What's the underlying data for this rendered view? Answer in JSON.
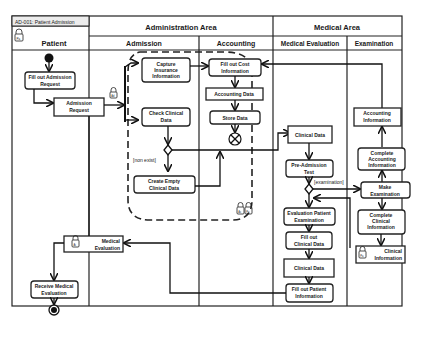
{
  "diagram": {
    "id_label": "AD-001: Patient Admission",
    "groups": [
      {
        "label": "Administration Area"
      },
      {
        "label": "Medical Area"
      }
    ],
    "lanes": [
      {
        "label": "Patient"
      },
      {
        "label": "Admission"
      },
      {
        "label": "Accounting"
      },
      {
        "label": "Medical Evaluation"
      },
      {
        "label": "Examination"
      }
    ],
    "nodes": {
      "fill_admission": [
        "Fill out Admission",
        "Request"
      ],
      "admission_request": [
        "Admission",
        "Request"
      ],
      "capture_insurance": [
        "Capture",
        "Insurance",
        "Information"
      ],
      "check_clinical": [
        "Check Clinical",
        "Data"
      ],
      "create_empty": [
        "Create Empty",
        "Clinical Data"
      ],
      "fill_cost": [
        "Fill out Cost",
        "Information"
      ],
      "accounting_data": [
        "Accounting Data"
      ],
      "store_data": [
        "Store Data"
      ],
      "clinical_data_1": [
        "Clinical Data"
      ],
      "pre_admission": [
        "Pre-Admission",
        "Test"
      ],
      "evaluation_patient": [
        "Evaluation Patient",
        "Examination"
      ],
      "fill_clinical": [
        "Fill out",
        "Clinical Data"
      ],
      "clinical_data_2": [
        "Clinical Data"
      ],
      "fill_patient": [
        "Fill out Patient",
        "Information"
      ],
      "accounting_info": [
        "Accounting",
        "Information"
      ],
      "complete_accounting": [
        "Complete",
        "Accounting",
        "Information"
      ],
      "make_exam": [
        "Make",
        "Examination"
      ],
      "complete_clinical": [
        "Complete",
        "Clinical",
        "Information"
      ],
      "clinical_info": [
        "Clinical",
        "Information"
      ],
      "medical_eval": [
        "Medical",
        "Evaluation"
      ],
      "receive_eval": [
        "Receive Medical",
        "Evaluation"
      ]
    },
    "guards": {
      "non_exist": "[non exist]",
      "examination": "[examination]"
    },
    "icon_tags": {
      "patient": "Pa",
      "admission": "Ad",
      "accounting": "Ac",
      "medical": "Ai"
    }
  }
}
